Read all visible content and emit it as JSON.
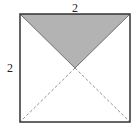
{
  "figure": {
    "type": "geometry-square-with-diagonals",
    "labels": {
      "top_side": "2",
      "left_side": "2"
    },
    "square": {
      "side_length": "2",
      "x": 20,
      "y": 14,
      "size": 110
    },
    "shaded_region": {
      "description": "triangle formed by top side and the two half-diagonals meeting at center",
      "fill": "#b3b3b3"
    },
    "colors": {
      "stroke": "#333333",
      "shade": "#b3b3b3",
      "dashed": "#777777"
    }
  }
}
